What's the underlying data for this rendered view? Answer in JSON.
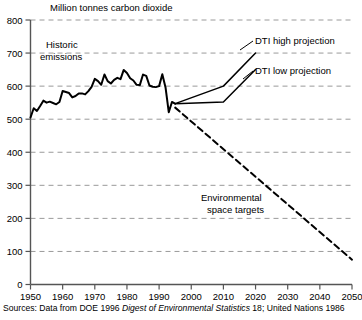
{
  "title": "Million tonnes carbon dioxide",
  "source": {
    "prefix": "Sources: Data from DOE 1996 ",
    "italic": "Digest of Environmental Statistics",
    "suffix": " 18; United Nations 1986"
  },
  "annotations": {
    "historic_line1": "Historic",
    "historic_line2": "emissions",
    "dti_high": "DTI high projection",
    "dti_low": "DTI low projection",
    "env_line1": "Environmental",
    "env_line2": "space targets"
  },
  "colors": {
    "line": "#000000",
    "grid": "#9a9a9a",
    "axis": "#4a4a4a",
    "background": "#ffffff"
  },
  "chart_data": {
    "type": "line",
    "title": "Million tonnes carbon dioxide",
    "xlabel": "",
    "ylabel": "Million tonnes carbon dioxide",
    "xlim": [
      1950,
      2050
    ],
    "ylim": [
      0,
      800
    ],
    "grid": true,
    "legend": "none",
    "xticks": [
      1950,
      1960,
      1970,
      1980,
      1990,
      2000,
      2010,
      2020,
      2030,
      2040,
      2050
    ],
    "yticks": [
      0,
      100,
      200,
      300,
      400,
      500,
      600,
      700,
      800
    ],
    "series": [
      {
        "name": "Historic emissions",
        "style": "solid",
        "x": [
          1950,
          1951,
          1952,
          1953,
          1954,
          1955,
          1956,
          1957,
          1958,
          1959,
          1960,
          1961,
          1962,
          1963,
          1964,
          1965,
          1966,
          1967,
          1968,
          1969,
          1970,
          1971,
          1972,
          1973,
          1974,
          1975,
          1976,
          1977,
          1978,
          1979,
          1980,
          1981,
          1982,
          1983,
          1984,
          1985,
          1986,
          1987,
          1988,
          1989,
          1990,
          1991,
          1992,
          1993,
          1994,
          1995
        ],
        "values": [
          505,
          533,
          525,
          540,
          556,
          550,
          553,
          549,
          545,
          552,
          585,
          582,
          579,
          566,
          570,
          578,
          578,
          575,
          585,
          598,
          622,
          615,
          604,
          635,
          615,
          608,
          619,
          625,
          621,
          649,
          640,
          624,
          617,
          604,
          603,
          635,
          631,
          602,
          598,
          597,
          600,
          636,
          596,
          521,
          552,
          547
        ]
      },
      {
        "name": "DTI high projection",
        "style": "solid",
        "x": [
          1995,
          2010,
          2020
        ],
        "values": [
          547,
          600,
          700
        ]
      },
      {
        "name": "DTI low projection",
        "style": "solid",
        "x": [
          1995,
          2010,
          2020
        ],
        "values": [
          547,
          552,
          650
        ]
      },
      {
        "name": "Environmental space targets",
        "style": "dashed",
        "x": [
          1995,
          2050
        ],
        "values": [
          535,
          75
        ]
      }
    ]
  }
}
